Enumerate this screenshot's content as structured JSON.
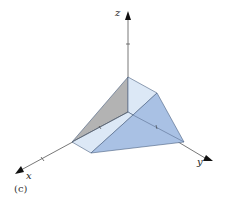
{
  "figure": {
    "caption": "(c)",
    "axes": {
      "x_label": "x",
      "y_label": "y",
      "z_label": "z"
    },
    "colors": {
      "axis": "#555555",
      "left_face": "#b3b3b3",
      "light_face": "#dce8f6",
      "dark_face": "#a9c1e4",
      "edge": "#4a5f80"
    }
  }
}
